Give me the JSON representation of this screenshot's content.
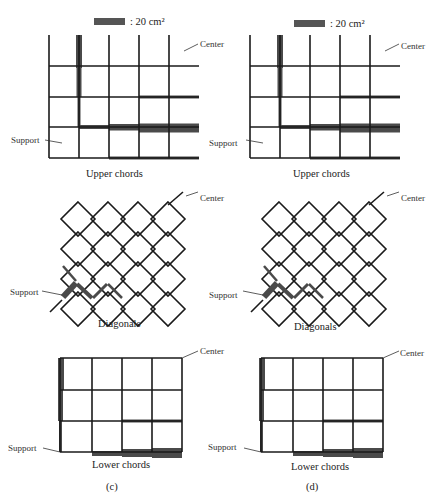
{
  "legend": {
    "swatch_label": ": 20 cm²",
    "swatch_color": "#555555"
  },
  "labels": {
    "center": "Center",
    "support": "Support"
  },
  "panels": [
    {
      "id": "c",
      "caption": "(c)",
      "upper_caption": "Upper chords",
      "diagonal_caption": "Diagonals",
      "lower_caption": "Lower chords"
    },
    {
      "id": "d",
      "caption": "(d)",
      "upper_caption": "Upper chords",
      "diagonal_caption": "Diagonals",
      "lower_caption": "Lower chords"
    }
  ],
  "colors": {
    "line": "#1a1a1a",
    "thick_member": "#4a4a4a",
    "background": "#ffffff"
  }
}
